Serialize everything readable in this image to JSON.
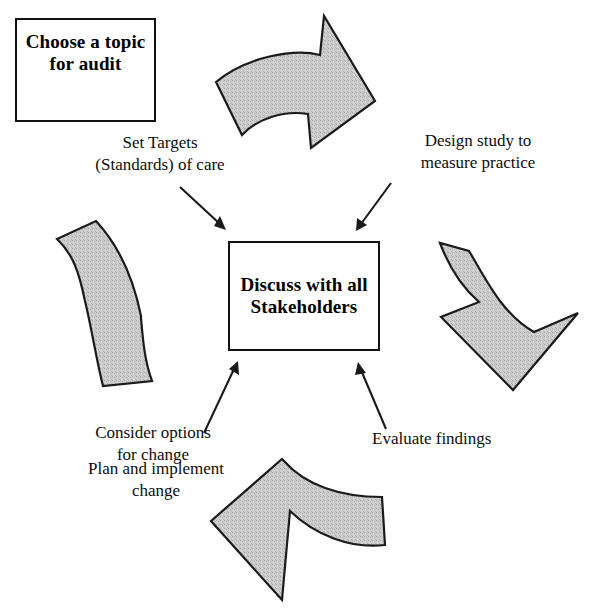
{
  "diagram": {
    "background_color": "#ffffff",
    "arrow_fill_color": "#c8c8c8",
    "arrow_stroke_color": "#1a1a1a",
    "text_color": "#000000",
    "boxes": [
      {
        "id": "topic",
        "text": "Choose a topic\nfor audit"
      },
      {
        "id": "center",
        "text": "Discuss with all\nStakeholders"
      }
    ],
    "labels": [
      {
        "id": "set_targets",
        "text": "Set Targets\n(Standards) of care"
      },
      {
        "id": "design_study",
        "text": "Design study to\nmeasure practice"
      },
      {
        "id": "consider",
        "text": "Consider options\nfor change"
      },
      {
        "id": "plan",
        "text": "Plan and implement\nchange"
      },
      {
        "id": "evaluate",
        "text": "Evaluate findings"
      }
    ],
    "cycle_arrows": [
      {
        "id": "top",
        "direction": "right-down",
        "position": "top"
      },
      {
        "id": "right",
        "direction": "down-left",
        "position": "right"
      },
      {
        "id": "bottom",
        "direction": "left-up",
        "position": "bottom"
      },
      {
        "id": "left",
        "direction": "up-right",
        "position": "left"
      }
    ],
    "connectors": [
      {
        "id": "topic-to-targets",
        "from": "Choose a topic for audit",
        "to": "Set Targets (Standards) of care"
      },
      {
        "id": "targets-to-center",
        "from": "Set Targets (Standards) of care",
        "to": "Discuss with all Stakeholders"
      },
      {
        "id": "design-to-center",
        "from": "Design study to measure practice",
        "to": "Discuss with all Stakeholders"
      },
      {
        "id": "consider-to-center",
        "from": "Consider options for change",
        "to": "Discuss with all Stakeholders"
      },
      {
        "id": "evaluate-to-center",
        "from": "Evaluate findings",
        "to": "Discuss with all Stakeholders"
      }
    ]
  }
}
